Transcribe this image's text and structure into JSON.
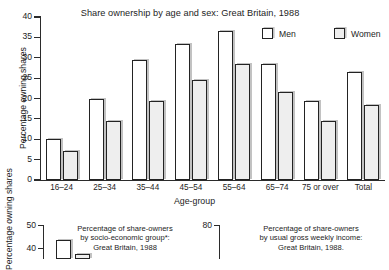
{
  "chart_data": [
    {
      "type": "bar",
      "title": "Share ownership by age and sex: Great Britain, 1988",
      "xlabel": "Age-group",
      "ylabel": "Percentage owning shares",
      "ylim": [
        0,
        40
      ],
      "yticks": [
        0,
        5,
        10,
        15,
        20,
        25,
        30,
        35,
        40
      ],
      "ytick_labels": [
        "0",
        "5",
        "10",
        "15",
        "20",
        "25",
        "30",
        "35",
        "40"
      ],
      "grid": false,
      "legend_position": "top-right",
      "categories": [
        "16–24",
        "25–34",
        "35–44",
        "45–54",
        "55–64",
        "65–74",
        "75 or over",
        "Total"
      ],
      "series": [
        {
          "name": "Men",
          "color": "#ffffff",
          "values": [
            10,
            20,
            29.5,
            33.5,
            36.5,
            28.5,
            19.5,
            26.5
          ]
        },
        {
          "name": "Women",
          "color": "#eeeeee",
          "values": [
            7,
            14.5,
            19.5,
            24.5,
            28.5,
            21.5,
            14.5,
            18.5
          ]
        }
      ]
    },
    {
      "type": "bar",
      "title": "Percentage of share-owners by socio-economic group*: Great Britain, 1988",
      "title_lines": [
        "Percentage of share-owners",
        "by socio-economic group*:",
        "Great Britain, 1988"
      ],
      "ylabel": "Percentage owning shares",
      "ylim": [
        0,
        50
      ],
      "yticks": [
        40,
        50
      ],
      "ytick_labels": [
        "40",
        "50"
      ],
      "categories": [],
      "values": [
        41
      ]
    },
    {
      "type": "bar",
      "title": "Percentage of share-owners by usual gross weekly income: Great Britain, 1988.",
      "title_lines": [
        "Percentage of share-owners",
        "by usual gross weekly income:",
        "Great Britain, 1988."
      ],
      "ylim": [
        0,
        80
      ],
      "yticks": [
        80
      ],
      "ytick_labels": [
        "80"
      ],
      "categories": [],
      "values": []
    }
  ],
  "main": {
    "title": "Share ownership by age and sex: Great Britain, 1988",
    "y_axis_title": "Percentage owning shares",
    "x_axis_title": "Age-group",
    "y_ticks": [
      "40",
      "35",
      "30",
      "25",
      "20",
      "15",
      "10",
      "5",
      "0"
    ],
    "categories": [
      "16–24",
      "25–34",
      "35–44",
      "45–54",
      "55–64",
      "65–74",
      "75 or over",
      "Total"
    ],
    "legend": [
      {
        "label": "Men"
      },
      {
        "label": "Women"
      }
    ]
  },
  "bottom_left": {
    "y_axis_title": "Percentage owning shares",
    "y_ticks": [
      "50",
      "40"
    ],
    "caption_line1": "Percentage of share-owners",
    "caption_line2": "by socio-economic group*:",
    "caption_line3": "Great Britain, 1988"
  },
  "bottom_right": {
    "y_ticks": [
      "80"
    ],
    "caption_line1": "Percentage of share-owners",
    "caption_line2": "by usual gross weekly income:",
    "caption_line3": "Great Britain, 1988."
  }
}
